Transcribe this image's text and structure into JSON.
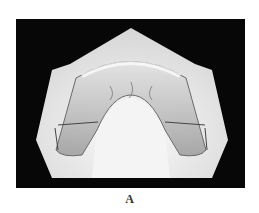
{
  "figure": {
    "label": "A",
    "colors": {
      "background": "#070707",
      "plaster": "#e8e8e8",
      "appliance": "#b9b9b9"
    }
  }
}
